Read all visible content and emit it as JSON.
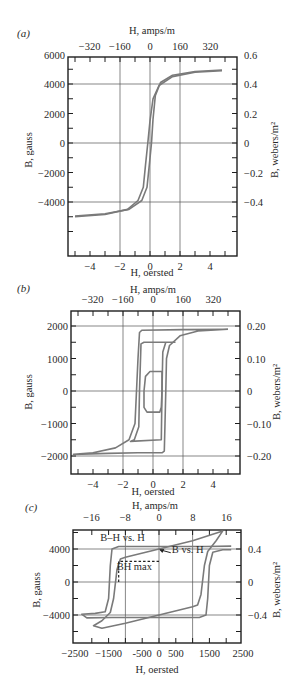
{
  "figure": {
    "panels": [
      "(a)",
      "(b)",
      "(c)"
    ]
  },
  "chart_data": [
    {
      "id": "a",
      "panel_label": "(a)",
      "type": "line",
      "title": "",
      "xlabel": "H, oersted",
      "x2label": "H, amps/m",
      "ylabel": "B, gauss",
      "y2label": "B, webers/m²",
      "xlim": [
        -5.6,
        5.6
      ],
      "ylim": [
        -7000,
        6000
      ],
      "x_ticks": [
        -4,
        -2,
        0,
        2,
        4
      ],
      "x_tick_labels": [
        "−4",
        "−2",
        "0",
        "2",
        "4"
      ],
      "x2_ticks": [
        -4.02,
        -2.01,
        0,
        2.01,
        4.02
      ],
      "x2_tick_labels": [
        "−320",
        "−160",
        "0",
        "160",
        "320"
      ],
      "y_ticks": [
        6000,
        4000,
        2000,
        0,
        -2000,
        -4000
      ],
      "y_tick_labels": [
        "6000",
        "4000",
        "2000",
        "0",
        "−2000",
        "−4000"
      ],
      "y2_tick_labels": [
        "0.6",
        "0.4",
        "0.2",
        "0",
        "−0.2",
        "−0.4"
      ],
      "gridlines_x": [
        -2,
        0,
        2
      ],
      "gridlines_y": [
        4000,
        0,
        -4000
      ],
      "series": [
        {
          "name": "ascending branch",
          "points": [
            [
              -5,
              -5000
            ],
            [
              -3,
              -4850
            ],
            [
              -1.5,
              -4500
            ],
            [
              -0.8,
              -3900
            ],
            [
              -0.45,
              -3000
            ],
            [
              -0.3,
              -1500
            ],
            [
              -0.15,
              0
            ],
            [
              0,
              1500
            ],
            [
              0.2,
              3000
            ],
            [
              0.6,
              3900
            ],
            [
              1.5,
              4500
            ],
            [
              3,
              4800
            ],
            [
              4.8,
              4900
            ]
          ]
        },
        {
          "name": "descending branch",
          "points": [
            [
              4.8,
              4950
            ],
            [
              3,
              4850
            ],
            [
              1.5,
              4600
            ],
            [
              0.7,
              4100
            ],
            [
              0.35,
              3200
            ],
            [
              0.2,
              1600
            ],
            [
              0.1,
              0
            ],
            [
              -0.05,
              -1500
            ],
            [
              -0.2,
              -3000
            ],
            [
              -0.55,
              -3900
            ],
            [
              -1.4,
              -4500
            ],
            [
              -3,
              -4800
            ],
            [
              -5,
              -4950
            ]
          ]
        }
      ]
    },
    {
      "id": "b",
      "panel_label": "(b)",
      "type": "line",
      "title": "",
      "xlabel": "H, oersted",
      "x2label": "H, amps/m",
      "ylabel": "B, gauss",
      "y2label": "B, webers/m²",
      "xlim": [
        -5.5,
        5.8
      ],
      "ylim": [
        -2500,
        2500
      ],
      "x_ticks": [
        -4,
        -2,
        0,
        2,
        4
      ],
      "x_tick_labels": [
        "−4",
        "−2",
        "0",
        "2",
        "4"
      ],
      "x2_ticks": [
        -4.02,
        -2.01,
        0,
        2.01,
        4.02
      ],
      "x2_tick_labels": [
        "−320",
        "−160",
        "0",
        "160",
        "320"
      ],
      "y_ticks": [
        2000,
        1000,
        0,
        -1000,
        -2000
      ],
      "y_tick_labels": [
        "2000",
        "1000",
        "0",
        "−1000",
        "−2000"
      ],
      "y2_tick_labels": [
        "0.20",
        "0.10",
        "0",
        "−0.10",
        "−0.20"
      ],
      "gridlines_x": [
        -2,
        0,
        2
      ],
      "gridlines_y": [
        2000,
        0,
        -2000
      ],
      "series": [
        {
          "name": "outer loop (saturation)",
          "points": [
            [
              5,
              1900
            ],
            [
              3,
              1850
            ],
            [
              1.8,
              1700
            ],
            [
              1.1,
              1400
            ],
            [
              0.9,
              1000
            ],
            [
              0.85,
              0
            ],
            [
              0.8,
              -1000
            ],
            [
              0.75,
              -1850
            ],
            [
              0.6,
              -1900
            ],
            [
              -1,
              -1900
            ],
            [
              -3,
              -1920
            ],
            [
              -5.3,
              -1950
            ],
            [
              -4,
              -1900
            ],
            [
              -2.5,
              -1750
            ],
            [
              -1.6,
              -1500
            ],
            [
              -1.2,
              -1000
            ],
            [
              -1.1,
              0
            ],
            [
              -1,
              1000
            ],
            [
              -0.9,
              1800
            ],
            [
              -0.75,
              1870
            ],
            [
              2,
              1890
            ],
            [
              5,
              1900
            ]
          ]
        },
        {
          "name": "middle loop",
          "points": [
            [
              1.5,
              1500
            ],
            [
              0.85,
              1500
            ],
            [
              0.65,
              1200
            ],
            [
              0.6,
              0
            ],
            [
              0.55,
              -1500
            ],
            [
              -1.5,
              -1550
            ],
            [
              -1.25,
              -1500
            ],
            [
              -0.95,
              -1100
            ],
            [
              -0.9,
              0
            ],
            [
              -0.8,
              1450
            ],
            [
              -0.6,
              1500
            ],
            [
              1.5,
              1500
            ]
          ]
        },
        {
          "name": "inner loop",
          "points": [
            [
              0.6,
              600
            ],
            [
              -0.2,
              600
            ],
            [
              -0.5,
              450
            ],
            [
              -0.6,
              0
            ],
            [
              -0.6,
              -500
            ],
            [
              -0.4,
              -650
            ],
            [
              0.45,
              -650
            ],
            [
              0.55,
              -500
            ],
            [
              0.6,
              0
            ],
            [
              0.6,
              600
            ]
          ]
        }
      ]
    },
    {
      "id": "c",
      "panel_label": "(c)",
      "type": "line",
      "title": "",
      "xlabel": "H, oersted",
      "x2label": "H, amps/m",
      "ylabel": "B, gauss",
      "y2label": "B, webers/m²",
      "xlim": [
        -2500,
        2500
      ],
      "ylim": [
        -6800,
        6800
      ],
      "x_ticks": [
        -2500,
        -1500,
        -500,
        0,
        500,
        1500,
        2500
      ],
      "x_tick_labels": [
        "−2500",
        "−1500",
        "-500",
        "0",
        "500",
        "1500",
        "2500"
      ],
      "x2_ticks": [
        -2010,
        -1005,
        0,
        1005,
        2010
      ],
      "x2_tick_labels": [
        "−16",
        "−8",
        "0",
        "8",
        "16"
      ],
      "y_ticks": [
        4000,
        0,
        -4000
      ],
      "y_tick_labels": [
        "4000",
        "0",
        "−4000"
      ],
      "y2_tick_labels": [
        "0.4",
        "0",
        "−0.4"
      ],
      "gridlines_x": [
        -1000,
        0,
        1000
      ],
      "gridlines_y": [
        4000,
        0,
        -4000
      ],
      "annotations": [
        {
          "text": "B–H  vs. H",
          "x": -1750,
          "y": 5000
        },
        {
          "text": "B  vs. H",
          "x": 380,
          "y": 3500
        },
        {
          "text": "BH max",
          "x": -1260,
          "y": 1500
        }
      ],
      "bh_max_point": {
        "H": -1200,
        "B": 2500
      },
      "series": [
        {
          "name": "B–H vs. H (intrinsic)",
          "points": [
            [
              2150,
              4350
            ],
            [
              1400,
              4300
            ],
            [
              -1200,
              4300
            ],
            [
              -1400,
              4000
            ],
            [
              -1450,
              2000
            ],
            [
              -1500,
              -2000
            ],
            [
              -1600,
              -3600
            ],
            [
              -1900,
              -3800
            ],
            [
              -2300,
              -3900
            ],
            [
              -2150,
              -4350
            ],
            [
              -1400,
              -4300
            ],
            [
              1200,
              -4300
            ],
            [
              1400,
              -4000
            ],
            [
              1450,
              -2000
            ],
            [
              1500,
              2000
            ],
            [
              1600,
              3600
            ],
            [
              1900,
              3900
            ],
            [
              2150,
              3900
            ]
          ]
        },
        {
          "name": "B vs. H (normal)",
          "points": [
            [
              1900,
              6200
            ],
            [
              1000,
              5000
            ],
            [
              0,
              4000
            ],
            [
              -1000,
              3000
            ],
            [
              -1150,
              2800
            ],
            [
              -1250,
              1500
            ],
            [
              -1350,
              -2000
            ],
            [
              -1450,
              -3700
            ],
            [
              -1700,
              -4700
            ],
            [
              -1950,
              -5300
            ],
            [
              -1700,
              -5600
            ],
            [
              -1000,
              -5000
            ],
            [
              0,
              -4000
            ],
            [
              1000,
              -3000
            ],
            [
              1150,
              -2800
            ],
            [
              1250,
              -1500
            ],
            [
              1350,
              2000
            ],
            [
              1450,
              3700
            ],
            [
              1700,
              5000
            ],
            [
              1900,
              6200
            ]
          ]
        }
      ]
    }
  ],
  "colors": {
    "curve": "#7a7a7a",
    "frame": "#1e1e1e",
    "grid": "#555555",
    "text": "#2a2a2a"
  }
}
